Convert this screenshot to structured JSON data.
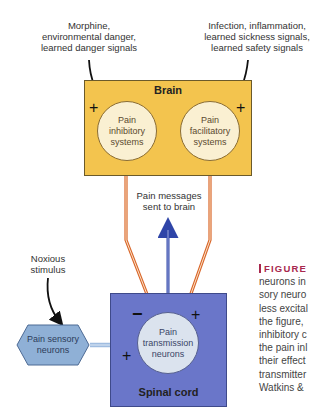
{
  "diagram": {
    "top_left_label": [
      "Morphine,",
      "environmental danger,",
      "learned danger signals"
    ],
    "top_right_label": [
      "Infection, inflammation,",
      "learned sickness signals,",
      "learned safety signals"
    ],
    "brain": {
      "title": "Brain",
      "left_system": [
        "Pain",
        "inhibitory",
        "systems"
      ],
      "right_system": [
        "Pain",
        "facilitatory",
        "systems"
      ],
      "left_sign": "+",
      "right_sign": "+"
    },
    "pathway_label": [
      "Pain messages",
      "sent to brain"
    ],
    "stimulus_label": [
      "Noxious",
      "stimulus"
    ],
    "sensory_neurons": [
      "Pain sensory",
      "neurons"
    ],
    "spinal_cord": {
      "title": "Spinal cord",
      "transmission": [
        "Pain",
        "transmission",
        "neurons"
      ],
      "inhibitory_sign": "−",
      "facilitatory_sign": "+",
      "sensory_sign": "+"
    },
    "colors": {
      "brain_fill": "#f3c44e",
      "spinal_fill": "#6a76c9",
      "orange_path": "#d9662a",
      "blue_path": "#2f45a8",
      "sensory_fill": "#8fb0d6",
      "caption_accent": "#a8284e"
    }
  },
  "caption": {
    "title": "FIGURE",
    "lines": [
      "neurons in",
      "sory neuro",
      "less excital",
      "the figure,",
      "inhibitory c",
      "the pain inl",
      "their effect",
      "transmitter",
      "Watkins &"
    ]
  }
}
